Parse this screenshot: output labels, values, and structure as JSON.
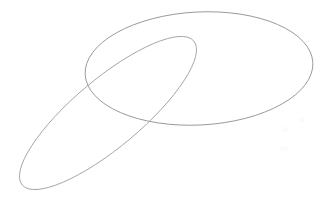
{
  "canvas": {
    "width": 319,
    "height": 197,
    "background_color": "#ffffff",
    "title": "Overlapping ellipse outline sketch"
  },
  "style": {
    "stroke_color": "#9a9a9e",
    "stroke_color_secondary": "#a6a6aa",
    "stroke_width": 1,
    "fill": "none"
  },
  "shapes": [
    {
      "name": "large-horizontal-ellipse",
      "type": "ellipse",
      "cx": 199,
      "cy": 68.5,
      "rx": 114,
      "ry": 56.5,
      "rotation_deg": -3,
      "stroke": "#9a9a9e",
      "stroke_width": 1
    },
    {
      "name": "narrow-tilted-ellipse",
      "type": "ellipse",
      "cx": 108,
      "cy": 113,
      "rx": 112,
      "ry": 34,
      "rotation_deg": -40,
      "stroke": "#a6a6aa",
      "stroke_width": 1,
      "clipped_edge": "bottom"
    }
  ],
  "specks": [
    {
      "name": "speck-upper",
      "x": 282,
      "y": 127,
      "w": 7,
      "h": 5
    },
    {
      "name": "speck-lower",
      "x": 280,
      "y": 146,
      "w": 8,
      "h": 5
    },
    {
      "name": "speck-right",
      "x": 299,
      "y": 118,
      "w": 5,
      "h": 4
    }
  ]
}
